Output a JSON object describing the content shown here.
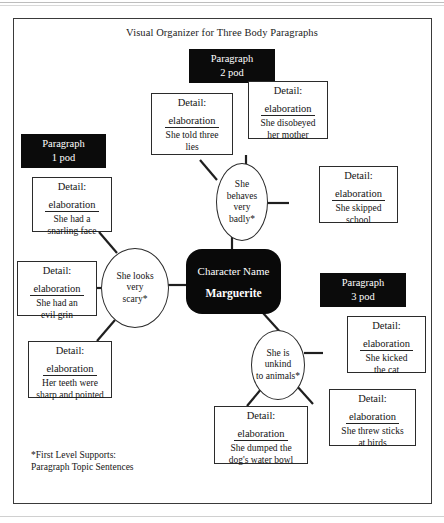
{
  "document": {
    "title": "Visual Organizer for Three Body Paragraphs",
    "footnote": "*First Level Supports:\nParagraph Topic Sentences"
  },
  "center_node": {
    "label": "Character Name",
    "name": "Marguerite"
  },
  "pods": [
    {
      "id": "pod-1",
      "text": "Paragraph\n1 pod"
    },
    {
      "id": "pod-2",
      "text": "Paragraph\n2 pod"
    },
    {
      "id": "pod-3",
      "text": "Paragraph\n3 pod"
    }
  ],
  "supports": [
    {
      "id": "support-looks",
      "text": "She looks\nvery\nscary*"
    },
    {
      "id": "support-behaves",
      "text": "She\nbehaves\nvery\nbadly*"
    },
    {
      "id": "support-unkind",
      "text": "She is\nunkind\nto animals*"
    }
  ],
  "details": [
    {
      "id": "detail-snarling-face",
      "head": "Detail:",
      "sub": "elaboration",
      "body": "She had a\nsnarling face"
    },
    {
      "id": "detail-evil-grin",
      "head": "Detail:",
      "sub": "elaboration",
      "body": "She had an\nevil grin"
    },
    {
      "id": "detail-teeth",
      "head": "Detail:",
      "sub": "elaboration",
      "body": "Her teeth were\nsharp and pointed"
    },
    {
      "id": "detail-three-lies",
      "head": "Detail:",
      "sub": "elaboration",
      "body": "She told three\nlies"
    },
    {
      "id": "detail-disobeyed",
      "head": "Detail:",
      "sub": "elaboration",
      "body": "She disobeyed\nher mother"
    },
    {
      "id": "detail-skipped-school",
      "head": "Detail:",
      "sub": "elaboration",
      "body": "She skipped\nschool"
    },
    {
      "id": "detail-kicked-cat",
      "head": "Detail:",
      "sub": "elaboration",
      "body": "She kicked\nthe cat"
    },
    {
      "id": "detail-threw-sticks",
      "head": "Detail:",
      "sub": "elaboration",
      "body": "She threw sticks\nat birds"
    },
    {
      "id": "detail-water-bowl",
      "head": "Detail:",
      "sub": "elaboration",
      "body": "She dumped the\ndog's water bowl"
    }
  ],
  "colors": {
    "node_fill": "#090909",
    "pod_fill": "#0b0b0b",
    "stroke": "#2b2b2b",
    "page": "#ffffff"
  }
}
